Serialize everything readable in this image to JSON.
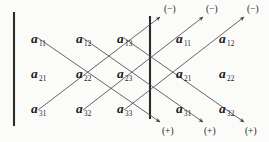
{
  "figure": {
    "ink_color": "#1c1c1c",
    "line_color": "#4a4a4a",
    "bar_color": "#2b2b2b",
    "background": "#fbfbfa"
  },
  "matrix": {
    "rows": 3,
    "cols": 3,
    "entries": [
      {
        "label": "a",
        "sub": "11",
        "x": 31,
        "y": 30,
        "role": "matrix-entry"
      },
      {
        "label": "a",
        "sub": "12",
        "x": 76,
        "y": 30,
        "role": "matrix-entry"
      },
      {
        "label": "a",
        "sub": "13",
        "x": 117,
        "y": 30,
        "role": "matrix-entry"
      },
      {
        "label": "a",
        "sub": "21",
        "x": 31,
        "y": 65,
        "role": "matrix-entry"
      },
      {
        "label": "a",
        "sub": "22",
        "x": 76,
        "y": 65,
        "role": "matrix-entry"
      },
      {
        "label": "a",
        "sub": "23",
        "x": 117,
        "y": 65,
        "role": "matrix-entry"
      },
      {
        "label": "a",
        "sub": "31",
        "x": 31,
        "y": 100,
        "role": "matrix-entry"
      },
      {
        "label": "a",
        "sub": "32",
        "x": 76,
        "y": 100,
        "role": "matrix-entry"
      },
      {
        "label": "a",
        "sub": "33",
        "x": 117,
        "y": 100,
        "role": "matrix-entry"
      }
    ]
  },
  "repeated_columns": {
    "description": "first two columns copied to the right of the matrix",
    "entries": [
      {
        "label": "a",
        "sub": "11",
        "x": 176,
        "y": 30,
        "role": "repeated-entry"
      },
      {
        "label": "a",
        "sub": "12",
        "x": 219,
        "y": 30,
        "role": "repeated-entry"
      },
      {
        "label": "a",
        "sub": "21",
        "x": 176,
        "y": 65,
        "role": "repeated-entry"
      },
      {
        "label": "a",
        "sub": "22",
        "x": 219,
        "y": 65,
        "role": "repeated-entry"
      },
      {
        "label": "a",
        "sub": "31",
        "x": 176,
        "y": 100,
        "role": "repeated-entry"
      },
      {
        "label": "a",
        "sub": "32",
        "x": 219,
        "y": 100,
        "role": "repeated-entry"
      }
    ]
  },
  "signs": {
    "negative_label": "(−)",
    "positive_label": "(+)",
    "negative": [
      {
        "text": "(−)",
        "x": 164,
        "y": 5
      },
      {
        "text": "(−)",
        "x": 206,
        "y": 5
      },
      {
        "text": "(−)",
        "x": 247,
        "y": 5
      }
    ],
    "positive": [
      {
        "text": "(+)",
        "x": 162,
        "y": 127
      },
      {
        "text": "(+)",
        "x": 204,
        "y": 127
      },
      {
        "text": "(+)",
        "x": 245,
        "y": 127
      }
    ]
  },
  "bars": [
    {
      "name": "matrix-left-bar",
      "x": 14,
      "y1": 12,
      "y2": 126,
      "width": 2.1
    },
    {
      "name": "matrix-right-bar",
      "x": 150,
      "y1": 16,
      "y2": 119,
      "width": 2.1
    }
  ],
  "diagonals": {
    "down_right_sign": "(+)",
    "up_right_sign": "(−)",
    "down_right": [
      {
        "name": "plus-diagonal-1",
        "x1": 38,
        "y1": 38,
        "x2": 160,
        "y2": 122
      },
      {
        "name": "plus-diagonal-2",
        "x1": 83,
        "y1": 38,
        "x2": 203,
        "y2": 122
      },
      {
        "name": "plus-diagonal-3",
        "x1": 124,
        "y1": 38,
        "x2": 244,
        "y2": 122
      }
    ],
    "up_right": [
      {
        "name": "minus-diagonal-1",
        "x1": 38,
        "y1": 110,
        "x2": 160,
        "y2": 17
      },
      {
        "name": "minus-diagonal-2",
        "x1": 83,
        "y1": 110,
        "x2": 203,
        "y2": 17
      },
      {
        "name": "minus-diagonal-3",
        "x1": 124,
        "y1": 110,
        "x2": 244,
        "y2": 17
      }
    ]
  }
}
